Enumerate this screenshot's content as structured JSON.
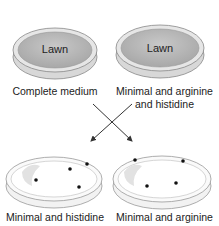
{
  "diagram": {
    "plates": [
      {
        "id": "top-left",
        "medium": "Complete medium",
        "content": "Lawn",
        "colonies": 0
      },
      {
        "id": "top-right",
        "medium_line1": "Minimal and arginine",
        "medium_line2": "and histidine",
        "content": "Lawn",
        "colonies": 0
      },
      {
        "id": "bottom-left",
        "medium": "Minimal and histidine",
        "content": "",
        "colonies": 4
      },
      {
        "id": "bottom-right",
        "medium": "Minimal and arginine",
        "content": "",
        "colonies": 4
      }
    ],
    "arrows": [
      "top-left to bottom-right",
      "top-right to bottom-left"
    ],
    "colors": {
      "lawn_fill": "#bdbdbd",
      "plate_rim": "#9e9e9e",
      "colony": "#111111",
      "background": "#ffffff"
    }
  }
}
